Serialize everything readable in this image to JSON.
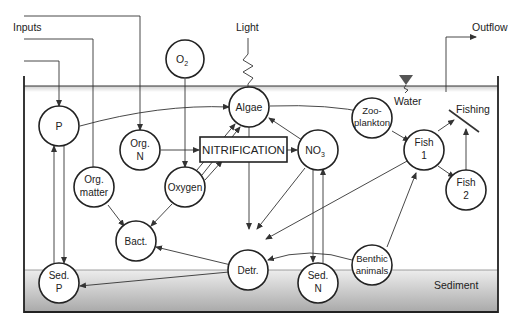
{
  "diagram": {
    "type": "aquatic ecosystem model",
    "labels": {
      "inputs": "Inputs",
      "light": "Light",
      "outflow": "Outflow",
      "water": "Water",
      "fishing": "Fishing",
      "sediment": "Sediment",
      "nitrification": "NITRIFICATION"
    },
    "nodes": {
      "o2": {
        "main": "O",
        "sub": "2"
      },
      "algae": {
        "line1": "Algae"
      },
      "p": {
        "line1": "P"
      },
      "org_n": {
        "line1": "Org.",
        "line2": "N"
      },
      "no3": {
        "main": "NO",
        "sub": "3"
      },
      "zooplankton": {
        "line1": "Zoo-",
        "line2": "plankton"
      },
      "fish1": {
        "line1": "Fish",
        "line2": "1"
      },
      "fish2": {
        "line1": "Fish",
        "line2": "2"
      },
      "org_matter": {
        "line1": "Org.",
        "line2": "matter"
      },
      "oxygen": {
        "line1": "Oxygen"
      },
      "bact": {
        "line1": "Bact."
      },
      "detr": {
        "line1": "Detr."
      },
      "sed_p": {
        "line1": "Sed.",
        "line2": "P"
      },
      "sed_n": {
        "line1": "Sed.",
        "line2": "N"
      },
      "benthic": {
        "line1": "Benthic",
        "line2": "animals"
      }
    },
    "colors": {
      "stroke": "#222222",
      "water_surface": "#d8d8d8",
      "sediment_top": "#e6e6e6",
      "sediment_bottom": "#a8a8a8"
    }
  }
}
